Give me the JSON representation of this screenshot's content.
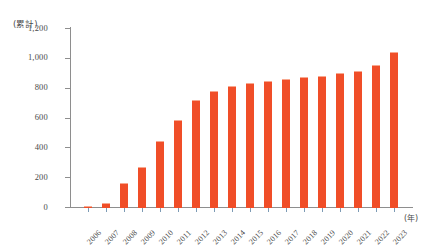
{
  "chart_data": {
    "type": "bar",
    "title": "",
    "subtitle": "",
    "xlabel": "(年)",
    "ylabel": "(累計)",
    "categories": [
      "2006",
      "2007",
      "2008",
      "2009",
      "2010",
      "2011",
      "2012",
      "2013",
      "2014",
      "2015",
      "2016",
      "2017",
      "2018",
      "2019",
      "2020",
      "2021",
      "2022",
      "2023"
    ],
    "values": [
      5,
      25,
      160,
      265,
      440,
      585,
      715,
      775,
      810,
      830,
      845,
      855,
      870,
      880,
      895,
      915,
      950,
      1040
    ],
    "series": [
      {
        "name": "累計",
        "values": [
          5,
          25,
          160,
          265,
          440,
          585,
          715,
          775,
          810,
          830,
          845,
          855,
          870,
          880,
          895,
          915,
          950,
          1040
        ]
      }
    ],
    "ylim": [
      0,
      1200
    ],
    "ytick_values": [
      0,
      200,
      400,
      600,
      800,
      1000,
      1200
    ],
    "ytick_labels": [
      "0",
      "200",
      "400",
      "600",
      "800",
      "1,000",
      "1,200"
    ],
    "grid": false,
    "legend": "none",
    "bar_color": "#f04e28",
    "axis_color": "#8e8e8e",
    "tick_color": "#7d9bb5",
    "background_color": "#ffffff"
  },
  "axis": {
    "unit_caption": "(累計)",
    "x_unit_caption": "(年)"
  }
}
